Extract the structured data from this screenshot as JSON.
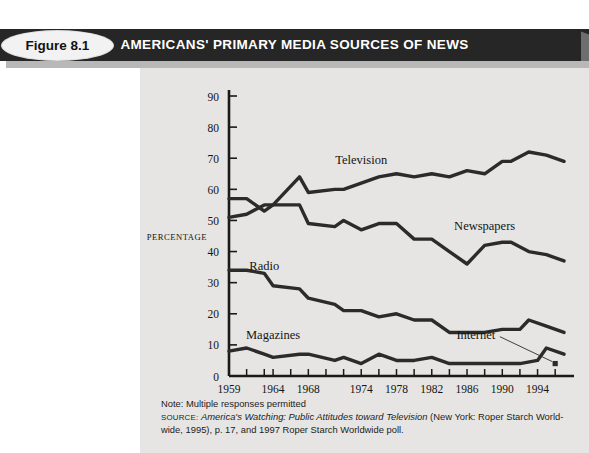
{
  "figure": {
    "tag": "Figure 8.1",
    "title": "AMERICANS' PRIMARY MEDIA SOURCES OF NEWS"
  },
  "caption": {
    "note": "Note: Multiple responses permitted",
    "source_prefix": "SOURCE:",
    "source_italic": "America's Watching: Public Attitudes toward Television",
    "source_rest": " (New York: Roper Starch World-",
    "source_line2": "wide, 1995), p. 17, and 1997 Roper Starch Worldwide poll."
  },
  "colors": {
    "header_bar": "#262626",
    "panel": "#e6e5e3",
    "line": "#2b2b2b",
    "axis": "#1a1a1a",
    "page": "#ffffff"
  },
  "chart_data": {
    "type": "line",
    "title": "AMERICANS' PRIMARY MEDIA SOURCES OF NEWS",
    "xlabel": "YEAR",
    "ylabel": "PERCENTAGE",
    "xlim": [
      1959,
      1997
    ],
    "ylim": [
      0,
      90
    ],
    "yticks": [
      0,
      10,
      20,
      30,
      40,
      50,
      60,
      70,
      80,
      90
    ],
    "xticks": [
      1959,
      1961,
      1963,
      1964,
      1966,
      1968,
      1970,
      1972,
      1974,
      1976,
      1978,
      1980,
      1982,
      1984,
      1986,
      1988,
      1990,
      1992,
      1994,
      1996
    ],
    "xtick_labels": [
      {
        "x": 1959,
        "label": "1959"
      },
      {
        "x": 1964,
        "label": "1964"
      },
      {
        "x": 1968,
        "label": "1968"
      },
      {
        "x": 1974,
        "label": "1974"
      },
      {
        "x": 1978,
        "label": "1978"
      },
      {
        "x": 1982,
        "label": "1982"
      },
      {
        "x": 1986,
        "label": "1986"
      },
      {
        "x": 1990,
        "label": "1990"
      },
      {
        "x": 1994,
        "label": "1994"
      }
    ],
    "grid": false,
    "legend": "inline-labels",
    "series": [
      {
        "name": "Television",
        "label_x": 1974,
        "label_y": 68,
        "x": [
          1959,
          1961,
          1963,
          1964,
          1967,
          1968,
          1971,
          1972,
          1974,
          1976,
          1978,
          1980,
          1982,
          1984,
          1986,
          1988,
          1990,
          1991,
          1993,
          1995,
          1997
        ],
        "values": [
          51,
          52,
          55,
          55,
          64,
          59,
          60,
          60,
          62,
          64,
          65,
          64,
          65,
          64,
          66,
          65,
          69,
          69,
          72,
          71,
          69
        ]
      },
      {
        "name": "Newspapers",
        "label_x": 1988,
        "label_y": 47,
        "x": [
          1959,
          1961,
          1963,
          1964,
          1967,
          1968,
          1971,
          1972,
          1974,
          1976,
          1978,
          1980,
          1982,
          1984,
          1986,
          1988,
          1990,
          1991,
          1993,
          1995,
          1997
        ],
        "values": [
          57,
          57,
          53,
          55,
          55,
          49,
          48,
          50,
          47,
          49,
          49,
          44,
          44,
          40,
          36,
          42,
          43,
          43,
          40,
          39,
          37
        ]
      },
      {
        "name": "Radio",
        "label_x": 1963,
        "label_y": 34,
        "x": [
          1959,
          1961,
          1963,
          1964,
          1967,
          1968,
          1971,
          1972,
          1974,
          1976,
          1978,
          1980,
          1982,
          1984,
          1986,
          1988,
          1990,
          1992,
          1993,
          1995,
          1997
        ],
        "values": [
          34,
          34,
          33,
          29,
          28,
          25,
          23,
          21,
          21,
          19,
          20,
          18,
          18,
          14,
          14,
          14,
          15,
          15,
          18,
          16,
          14
        ]
      },
      {
        "name": "Magazines",
        "label_x": 1964,
        "label_y": 12,
        "x": [
          1959,
          1961,
          1963,
          1964,
          1967,
          1968,
          1971,
          1972,
          1974,
          1976,
          1978,
          1980,
          1982,
          1984,
          1986,
          1988,
          1990,
          1992,
          1994,
          1995,
          1997
        ],
        "values": [
          8,
          9,
          7,
          6,
          7,
          7,
          5,
          6,
          4,
          7,
          5,
          5,
          6,
          4,
          4,
          4,
          4,
          4,
          5,
          9,
          7
        ]
      },
      {
        "name": "Internet",
        "label_x": 1987,
        "label_y": 12,
        "marker_x": 1996,
        "marker_y": 4,
        "x": [
          1996
        ],
        "values": [
          4
        ]
      }
    ]
  }
}
